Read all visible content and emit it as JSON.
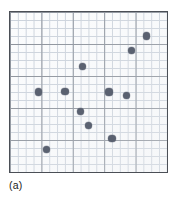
{
  "figure": {
    "caption": "(a)",
    "panel_label": "(a)",
    "background_color": "#ffffff"
  },
  "plot": {
    "frame_color": "#4b4f56",
    "plot_background": "#fbfcfd",
    "minor_grid_color": "#ccd3dc",
    "major_grid_color": "#8a9099",
    "point_color": "#5a6170",
    "grid_columns": 20,
    "grid_rows": 20,
    "major_every": 4,
    "show_axis_labels": false,
    "show_tick_labels": false
  },
  "chart_data": {
    "type": "scatter",
    "title": "",
    "subtitle": "",
    "xlabel": "",
    "ylabel": "",
    "annotations": [
      "(a)"
    ],
    "legend": [],
    "legend_position": "none",
    "grid": true,
    "grid_columns": 20,
    "grid_rows": 20,
    "xlim": [
      0,
      20
    ],
    "ylim": [
      0,
      20
    ],
    "xtick_labels": [],
    "ytick_labels": [],
    "marker": "filled-circle",
    "marker_color": "#5a6170",
    "n_points": 12,
    "x": [
      17.4,
      15.5,
      9.2,
      3.6,
      7.0,
      12.6,
      14.8,
      9.0,
      10.0,
      13.0,
      4.6,
      9.2
    ],
    "y": [
      17.0,
      15.2,
      13.2,
      10.0,
      10.1,
      10.0,
      9.6,
      7.6,
      5.8,
      4.2,
      2.8,
      13.2
    ],
    "points": [
      {
        "x": 17.4,
        "y": 17.0
      },
      {
        "x": 15.5,
        "y": 15.2
      },
      {
        "x": 9.2,
        "y": 13.2
      },
      {
        "x": 3.6,
        "y": 10.0
      },
      {
        "x": 7.0,
        "y": 10.1
      },
      {
        "x": 12.6,
        "y": 10.0
      },
      {
        "x": 14.8,
        "y": 9.6
      },
      {
        "x": 9.0,
        "y": 7.6
      },
      {
        "x": 10.0,
        "y": 5.8
      },
      {
        "x": 13.0,
        "y": 4.2
      },
      {
        "x": 4.6,
        "y": 2.8
      }
    ]
  }
}
